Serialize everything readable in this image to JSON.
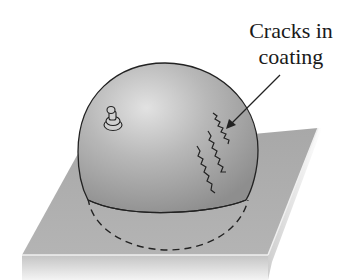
{
  "diagram": {
    "annotations": [
      {
        "id": "cracks",
        "line1": "Cracks in",
        "line2": "coating"
      }
    ],
    "elements": {
      "plate": "flat square base plate shown in perspective",
      "dome": "hemispherical shell with coating",
      "fitting": "small knob / fitting on upper-left of dome",
      "cracks": "three wavy crack lines on right side of dome",
      "hidden_base": "dashed line showing hidden lower edge of hemisphere"
    },
    "colors": {
      "plate_top": "#9a9a9a",
      "plate_edge": "#d4d4d4",
      "dome_light": "#d8d8d8",
      "dome_dark": "#8c8c8c",
      "line": "#222222"
    }
  }
}
